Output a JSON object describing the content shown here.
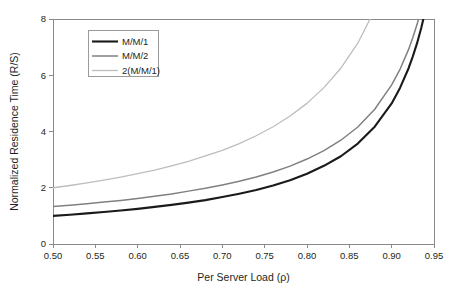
{
  "chart_data": {
    "type": "line",
    "title": "",
    "xlabel": "Per Server Load (ρ)",
    "ylabel": "Normalized Residence Time (R/S)",
    "xlim": [
      0.5,
      0.95
    ],
    "ylim": [
      0,
      8
    ],
    "xticks": [
      0.5,
      0.55,
      0.6,
      0.65,
      0.7,
      0.75,
      0.8,
      0.85,
      0.9,
      0.95
    ],
    "xtick_labels": [
      "0.50",
      "0.55",
      "0.60",
      "0.65",
      "0.70",
      "0.75",
      "0.80",
      "0.85",
      "0.90",
      "0.95"
    ],
    "yticks": [
      0,
      2,
      4,
      6,
      8
    ],
    "ytick_labels": [
      "0",
      "2",
      "4",
      "6",
      "8"
    ],
    "grid": false,
    "legend_position": "top-left",
    "x": [
      0.5,
      0.52,
      0.54,
      0.56,
      0.58,
      0.6,
      0.62,
      0.64,
      0.66,
      0.68,
      0.7,
      0.72,
      0.74,
      0.76,
      0.78,
      0.8,
      0.82,
      0.84,
      0.86,
      0.88,
      0.9,
      0.91,
      0.92,
      0.925,
      0.93,
      0.935,
      0.94,
      0.945,
      0.95
    ],
    "series": [
      {
        "name": "M/M/1",
        "color": "#1a1a1a",
        "width": 2.1,
        "values": [
          1.0,
          1.04,
          1.09,
          1.14,
          1.19,
          1.25,
          1.32,
          1.39,
          1.47,
          1.56,
          1.67,
          1.79,
          1.92,
          2.08,
          2.27,
          2.5,
          2.78,
          3.12,
          3.57,
          4.17,
          5.0,
          5.56,
          6.25,
          6.67,
          7.14,
          7.69,
          8.33,
          9.09,
          10.0
        ]
      },
      {
        "name": "M/M/2",
        "color": "#808080",
        "width": 1.5,
        "values": [
          1.33,
          1.38,
          1.43,
          1.49,
          1.55,
          1.62,
          1.7,
          1.78,
          1.88,
          1.98,
          2.1,
          2.23,
          2.38,
          2.56,
          2.77,
          3.02,
          3.32,
          3.69,
          4.16,
          4.79,
          5.66,
          6.22,
          6.92,
          7.34,
          7.81,
          8.36,
          8.99,
          9.73,
          10.62
        ]
      },
      {
        "name": "2(M/M/1)",
        "color": "#bdbdbd",
        "width": 1.3,
        "values": [
          2.0,
          2.08,
          2.17,
          2.27,
          2.38,
          2.5,
          2.63,
          2.78,
          2.94,
          3.13,
          3.33,
          3.57,
          3.85,
          4.17,
          4.55,
          5.0,
          5.56,
          6.25,
          7.14,
          8.33,
          10.0,
          11.11,
          12.5,
          13.33,
          14.29,
          15.38,
          16.67,
          18.18,
          20.0
        ]
      }
    ]
  },
  "legend": {
    "entries": [
      {
        "label": "M/M/1"
      },
      {
        "label": "M/M/2"
      },
      {
        "label": "2(M/M/1)"
      }
    ]
  }
}
